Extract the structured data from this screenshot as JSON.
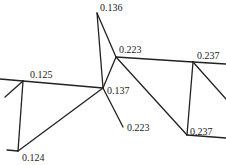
{
  "diagram": {
    "type": "line-network",
    "stroke_color": "#222222",
    "background": "#ffffff",
    "nodes": [
      {
        "id": "A",
        "x": 23,
        "y": 81,
        "label": "0.125",
        "lx": 30,
        "ly": 78
      },
      {
        "id": "B",
        "x": 18,
        "y": 151,
        "label": "0.124",
        "lx": 22,
        "ly": 161
      },
      {
        "id": "C",
        "x": 97,
        "y": 13,
        "label": "0.136",
        "lx": 100,
        "ly": 11
      },
      {
        "id": "D",
        "x": 103,
        "y": 88,
        "label": "0.137",
        "lx": 107,
        "ly": 94
      },
      {
        "id": "E",
        "x": 116,
        "y": 57,
        "label": "0.223",
        "lx": 119,
        "ly": 53
      },
      {
        "id": "F",
        "x": 123,
        "y": 127,
        "label": "0.223",
        "lx": 127,
        "ly": 131
      },
      {
        "id": "G",
        "x": 193,
        "y": 62,
        "label": "0.237",
        "lx": 197,
        "ly": 59
      },
      {
        "id": "H",
        "x": 187,
        "y": 135,
        "label": "0.237",
        "lx": 190,
        "ly": 135
      }
    ],
    "segments": [
      {
        "x1": 0,
        "y1": 79,
        "x2": 23,
        "y2": 81
      },
      {
        "x1": 23,
        "y1": 81,
        "x2": 103,
        "y2": 88
      },
      {
        "x1": 23,
        "y1": 81,
        "x2": 5,
        "y2": 97
      },
      {
        "x1": 23,
        "y1": 81,
        "x2": 18,
        "y2": 151
      },
      {
        "x1": 7,
        "y1": 150,
        "x2": 18,
        "y2": 151
      },
      {
        "x1": 18,
        "y1": 151,
        "x2": 103,
        "y2": 88
      },
      {
        "x1": 97,
        "y1": 13,
        "x2": 103,
        "y2": 88
      },
      {
        "x1": 97,
        "y1": 13,
        "x2": 116,
        "y2": 57
      },
      {
        "x1": 103,
        "y1": 88,
        "x2": 116,
        "y2": 57
      },
      {
        "x1": 103,
        "y1": 88,
        "x2": 123,
        "y2": 127
      },
      {
        "x1": 116,
        "y1": 57,
        "x2": 193,
        "y2": 62
      },
      {
        "x1": 116,
        "y1": 57,
        "x2": 187,
        "y2": 135
      },
      {
        "x1": 193,
        "y1": 62,
        "x2": 226,
        "y2": 64
      },
      {
        "x1": 193,
        "y1": 62,
        "x2": 187,
        "y2": 135
      },
      {
        "x1": 193,
        "y1": 62,
        "x2": 226,
        "y2": 99
      },
      {
        "x1": 187,
        "y1": 135,
        "x2": 226,
        "y2": 138
      }
    ]
  }
}
